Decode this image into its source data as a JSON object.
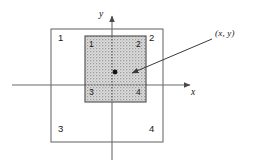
{
  "figure": {
    "type": "diagram",
    "background_color": "#ffffff",
    "line_color": "#6e6e6e",
    "dark_line_color": "#3a3a3a",
    "fill_color": "#d9d9d9",
    "text_color": "#161616",
    "width": 255,
    "height": 166
  },
  "axes": {
    "x_axis": {
      "label": "x",
      "label_x": 196,
      "label_y": 92,
      "y_position": 85,
      "x_start": 12,
      "x_end": 192,
      "arrow": "right"
    },
    "y_axis": {
      "label": "y",
      "label_x": 100,
      "label_y": 14,
      "x_position": 112,
      "y_start": 14,
      "y_end": 160,
      "arrow": "up"
    }
  },
  "outer_square": {
    "name": "outer-square",
    "x": 51,
    "y": 29,
    "width": 112,
    "height": 113,
    "fill": "none",
    "stroke": "#6e6e6e",
    "quadrant_labels": [
      {
        "text": "1",
        "x": 58,
        "y": 36,
        "position": "top-left"
      },
      {
        "text": "2",
        "x": 150,
        "y": 36,
        "position": "top-right"
      },
      {
        "text": "3",
        "x": 58,
        "y": 124,
        "position": "bottom-left"
      },
      {
        "text": "4",
        "x": 150,
        "y": 124,
        "position": "bottom-right"
      }
    ]
  },
  "inner_square": {
    "name": "inner-square",
    "x": 85,
    "y": 36,
    "width": 61,
    "height": 66,
    "fill": "stippled-gray",
    "fill_color": "#d7d7d7",
    "stroke": "#5a5a5a",
    "quadrant_labels": [
      {
        "text": "1",
        "x": 89,
        "y": 41,
        "position": "top-left"
      },
      {
        "text": "2",
        "x": 136,
        "y": 41,
        "position": "top-right"
      },
      {
        "text": "3",
        "x": 89,
        "y": 89,
        "position": "bottom-left"
      },
      {
        "text": "4",
        "x": 136,
        "y": 89,
        "position": "bottom-right"
      }
    ]
  },
  "point": {
    "name": "data-point",
    "label": "(x, y)",
    "dot_x": 115,
    "dot_y": 72,
    "dot_radius": 2.4,
    "dot_color": "#111111",
    "label_x": 217,
    "label_y": 32,
    "leader_line": {
      "from_x": 212,
      "from_y": 39,
      "to_x": 129,
      "to_y": 74,
      "arrow_at": "to"
    }
  }
}
